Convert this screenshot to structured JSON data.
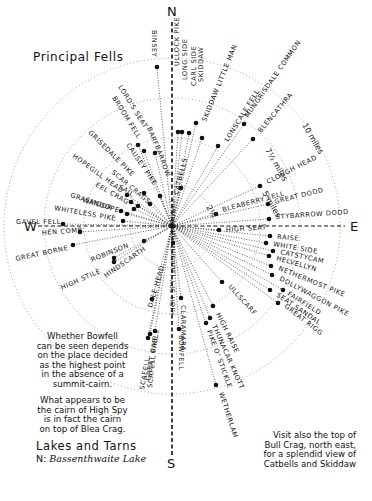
{
  "title": "Principal Fells",
  "compass": {
    "n": "N",
    "s": "S",
    "e": "E",
    "w": "W"
  },
  "center": {
    "x": 172,
    "y": 226
  },
  "rings": [
    {
      "label": "2½",
      "r": 42,
      "label_pos": {
        "x": 206,
        "y": 207,
        "rot": 60
      }
    },
    {
      "label": "5 miles",
      "r": 88,
      "label_pos": {
        "x": 262,
        "y": 193,
        "rot": 60
      }
    },
    {
      "label": "7½ miles",
      "r": 128,
      "label_pos": {
        "x": 265,
        "y": 150,
        "rot": 60
      }
    },
    {
      "label": "10 miles",
      "r": 168,
      "label_pos": {
        "x": 302,
        "y": 125,
        "rot": 60
      }
    }
  ],
  "fells": [
    {
      "name": "BINSEY",
      "dot": [
        157,
        67
      ],
      "tx": 152,
      "ty": 30,
      "rot": 90
    },
    {
      "name": "ULLOCK PIKE",
      "dot": [
        178,
        132
      ],
      "tx": 179,
      "ty": 66,
      "rot": -90
    },
    {
      "name": "LONG SIDE",
      "dot": [
        182,
        132
      ],
      "tx": 187,
      "ty": 80,
      "rot": -90
    },
    {
      "name": "CARL SIDE",
      "dot": [
        189,
        133
      ],
      "tx": 196,
      "ty": 86,
      "rot": -90
    },
    {
      "name": "SKIDDAW",
      "dot": [
        196,
        123
      ],
      "tx": 203,
      "ty": 82,
      "rot": -90
    },
    {
      "name": "SKIDDAW LITTLE MAN",
      "dot": [
        202,
        138
      ],
      "tx": 206,
      "ty": 122,
      "rot": -68
    },
    {
      "name": "LONSCALE FELL",
      "dot": [
        218,
        146
      ],
      "tx": 228,
      "ty": 142,
      "rot": -58
    },
    {
      "name": "MUNGRISDALE COMMON",
      "dot": [
        244,
        124
      ],
      "tx": 248,
      "ty": 118,
      "rot": -55
    },
    {
      "name": "BLENCATHRA",
      "dot": [
        253,
        139
      ],
      "tx": 261,
      "ty": 133,
      "rot": -50
    },
    {
      "name": "CLOUGH HEAD",
      "dot": [
        260,
        186
      ],
      "tx": 268,
      "ty": 184,
      "rot": -27
    },
    {
      "name": "BLEABERRY FELL",
      "dot": [
        216,
        214
      ],
      "tx": 223,
      "ty": 212,
      "rot": -15
    },
    {
      "name": "GREAT DODD",
      "dot": [
        268,
        204
      ],
      "tx": 275,
      "ty": 204,
      "rot": -14
    },
    {
      "name": "STYBARROW DODD",
      "dot": [
        269,
        219
      ],
      "tx": 276,
      "ty": 219,
      "rot": -4
    },
    {
      "name": "HIGH SEAT",
      "dot": [
        219,
        230
      ],
      "tx": 226,
      "ty": 232,
      "rot": -4
    },
    {
      "name": "RAISE",
      "dot": [
        270,
        236
      ],
      "tx": 277,
      "ty": 239,
      "rot": 4
    },
    {
      "name": "WHITE SIDE",
      "dot": [
        266,
        243
      ],
      "tx": 273,
      "ty": 246,
      "rot": 10
    },
    {
      "name": "CATSTYCAM",
      "dot": [
        273,
        251
      ],
      "tx": 280,
      "ty": 254,
      "rot": 12
    },
    {
      "name": "HELVELLYN",
      "dot": [
        269,
        256
      ],
      "tx": 276,
      "ty": 260,
      "rot": 16
    },
    {
      "name": "NETHERMOST PIKE",
      "dot": [
        271,
        266
      ],
      "tx": 278,
      "ty": 270,
      "rot": 22
    },
    {
      "name": "DOLLYWAGGON PIKE",
      "dot": [
        272,
        275
      ],
      "tx": 279,
      "ty": 280,
      "rot": 28
    },
    {
      "name": "FAIRFIELD",
      "dot": [
        283,
        290
      ],
      "tx": 287,
      "ty": 295,
      "rot": 32
    },
    {
      "name": "SEAT SANDAL",
      "dot": [
        270,
        290
      ],
      "tx": 276,
      "ty": 296,
      "rot": 34
    },
    {
      "name": "GREAT RIGG",
      "dot": [
        278,
        303
      ],
      "tx": 284,
      "ty": 307,
      "rot": 38
    },
    {
      "name": "ULLSCARF",
      "dot": [
        222,
        282
      ],
      "tx": 228,
      "ty": 287,
      "rot": 48
    },
    {
      "name": "HIGH RAISE",
      "dot": [
        213,
        306
      ],
      "tx": 216,
      "ty": 314,
      "rot": 64
    },
    {
      "name": "THUNACAR KNOTT",
      "dot": [
        210,
        318
      ],
      "tx": 212,
      "ty": 326,
      "rot": 66
    },
    {
      "name": "PIKE O' STICKLE",
      "dot": [
        206,
        323
      ],
      "tx": 207,
      "ty": 331,
      "rot": 70
    },
    {
      "name": "WETHERLAM",
      "dot": [
        216,
        385
      ],
      "tx": 219,
      "ty": 393,
      "rot": 72
    },
    {
      "name": "CLARAMARA",
      "dot": [
        181,
        298
      ],
      "tx": 181,
      "ty": 305,
      "rot": 90
    },
    {
      "name": "BOWFELL",
      "dot": [
        179,
        329
      ],
      "tx": 179,
      "ty": 335,
      "rot": 90
    },
    {
      "name": "HIGH SPY (summit not shown)",
      "dot": [
        173,
        243
      ],
      "tx": 175,
      "ty": 315,
      "rot": -90
    },
    {
      "name": "GREAT GABLE",
      "dot": [
        150,
        334
      ],
      "tx": 150,
      "ty": 381,
      "rot": -80
    },
    {
      "name": "SCAFELL",
      "dot": [
        148,
        338
      ],
      "tx": 144,
      "ty": 390,
      "rot": -80
    },
    {
      "name": "SCAFELL PIKE",
      "dot": [
        155,
        331
      ],
      "tx": 152,
      "ty": 388,
      "rot": -84
    },
    {
      "name": "DALE HEAD",
      "dot": [
        152,
        299
      ],
      "tx": 152,
      "ty": 308,
      "rot": -74
    },
    {
      "name": "HINDSCARTH",
      "dot": [
        114,
        258
      ],
      "tx": 106,
      "ty": 278,
      "rot": -35
    },
    {
      "name": "ROBINSON",
      "dot": [
        144,
        241
      ],
      "tx": 92,
      "ty": 262,
      "rot": -22
    },
    {
      "name": "HIGH STILE",
      "dot": [
        114,
        262
      ],
      "tx": 62,
      "ty": 290,
      "rot": -24
    },
    {
      "name": "GREAT BORNE",
      "dot": [
        73,
        245
      ],
      "tx": 16,
      "ty": 261,
      "rot": -12
    },
    {
      "name": "HEN COMB",
      "dot": [
        80,
        232
      ],
      "tx": 42,
      "ty": 235,
      "rot": -4
    },
    {
      "name": "GAVEL FELL",
      "dot": [
        63,
        224
      ],
      "tx": 16,
      "ty": 224,
      "rot": 0
    },
    {
      "name": "WHITELESS PIKE",
      "dot": [
        123,
        221
      ],
      "tx": 54,
      "ty": 210,
      "rot": 10
    },
    {
      "name": "WANDOPE",
      "dot": [
        127,
        214
      ],
      "tx": 82,
      "ty": 202,
      "rot": 16
    },
    {
      "name": "GRASMOOR",
      "dot": [
        121,
        211
      ],
      "tx": 70,
      "ty": 197,
      "rot": 18
    },
    {
      "name": "EEL CRAG",
      "dot": [
        134,
        209
      ],
      "tx": 95,
      "ty": 186,
      "rot": 30
    },
    {
      "name": "SAIL",
      "dot": [
        138,
        206
      ],
      "tx": 118,
      "ty": 188,
      "rot": 32
    },
    {
      "name": "HOPEGILL HEAD",
      "dot": [
        131,
        202
      ],
      "tx": 72,
      "ty": 157,
      "rot": 36
    },
    {
      "name": "SCAR CRAGS",
      "dot": [
        150,
        204
      ],
      "tx": 111,
      "ty": 173,
      "rot": 40
    },
    {
      "name": "GRISEDALE PIKE",
      "dot": [
        127,
        195
      ],
      "tx": 88,
      "ty": 133,
      "rot": 45
    },
    {
      "name": "CAUSEY PIKE",
      "dot": [
        144,
        193
      ],
      "tx": 126,
      "ty": 145,
      "rot": 56
    },
    {
      "name": "LORD'S SEAT",
      "dot": [
        138,
        145
      ],
      "tx": 118,
      "ty": 87,
      "rot": 58
    },
    {
      "name": "BROOM FELL",
      "dot": [
        144,
        151
      ],
      "tx": 112,
      "ty": 98,
      "rot": 58
    },
    {
      "name": "BARF",
      "dot": [
        155,
        153
      ],
      "tx": 147,
      "ty": 128,
      "rot": 68
    },
    {
      "name": "BARROW",
      "dot": [
        160,
        196
      ],
      "tx": 155,
      "ty": 146,
      "rot": 70
    },
    {
      "name": "CATBELLS",
      "dot": [
        181,
        188
      ],
      "tx": 178,
      "ty": 195,
      "rot": -76
    }
  ],
  "notes": {
    "bowfell": [
      "Whether Bowfell",
      "can be seen depends",
      "on the place decided",
      "as the highest point",
      "in the absence of a",
      "summit-cairn."
    ],
    "high_spy": [
      "What appears to be",
      "the cairn of High Spy",
      "is in fact the cairn",
      "on top of Blea Crag."
    ],
    "bull_crag": [
      "Visit also the top of",
      "Bull Crag, north east,",
      "for a splendid view of",
      "Catbells and Skiddaw"
    ]
  },
  "lakes": {
    "heading": "Lakes and Tarns",
    "prefix": "N:",
    "items": "Bassenthwaite Lake"
  }
}
